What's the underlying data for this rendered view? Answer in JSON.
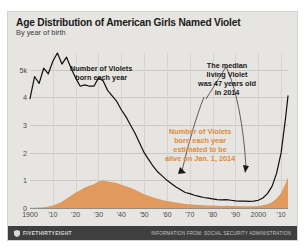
{
  "header": {
    "title": "Age Distribution of American Girls Named Violet",
    "subtitle": "By year of birth"
  },
  "footer": {
    "brand": "FIVETHIRTYEIGHT",
    "logo_icon": "shield-icon",
    "source": "INFORMATION FROM: SOCIAL SECURITY ADMINISTRATION"
  },
  "colors": {
    "background": "#e6e5e1",
    "line": "#101010",
    "area": "#e09a5e",
    "area_text": "#e08a3c",
    "footer_bg": "#3f3f3f",
    "grid": "#c9c8c3"
  },
  "chart_data": {
    "type": "line",
    "title": "Age Distribution of American Girls Named Violet",
    "subtitle": "By year of birth",
    "xlabel": "",
    "ylabel": "",
    "xlim": [
      1900,
      2013
    ],
    "ylim": [
      0,
      5600
    ],
    "grid": true,
    "legend_position": "annotations",
    "ytick_labels": [
      "0",
      "1",
      "2",
      "3",
      "4",
      "5k"
    ],
    "ytick_values": [
      0,
      1000,
      2000,
      3000,
      4000,
      5000
    ],
    "xtick_labels": [
      "1900",
      "'10",
      "'20",
      "'30",
      "'40",
      "'50",
      "'60",
      "'70",
      "'80",
      "'90",
      "2000",
      "'10"
    ],
    "xtick_values": [
      1900,
      1910,
      1920,
      1930,
      1940,
      1950,
      1960,
      1970,
      1980,
      1990,
      2000,
      2010
    ],
    "annotations": [
      {
        "name": "born-each-year",
        "text": "Number of Violets\nborn each year",
        "color": "#1a1a1a",
        "points_to_series": "born"
      },
      {
        "name": "median-living-violet",
        "text": "The median\nliving Violet\nwas 47 years old\nin 2014",
        "color": "#1a1a1a"
      },
      {
        "name": "estimated-alive",
        "text": "Number of Violets\nborn each year\nestimated to be\nalive on Jan. 1, 2014",
        "color": "#e08a3c",
        "points_to_series": "alive"
      }
    ],
    "series": [
      {
        "name": "born",
        "label": "Number of Violets born each year",
        "style": "line",
        "color": "#101010",
        "x": [
          1900,
          1902,
          1904,
          1906,
          1908,
          1910,
          1912,
          1914,
          1916,
          1918,
          1920,
          1922,
          1924,
          1926,
          1928,
          1930,
          1932,
          1934,
          1936,
          1938,
          1940,
          1942,
          1944,
          1946,
          1948,
          1950,
          1952,
          1954,
          1956,
          1958,
          1960,
          1962,
          1964,
          1966,
          1968,
          1970,
          1972,
          1974,
          1976,
          1978,
          1980,
          1982,
          1984,
          1986,
          1988,
          1990,
          1992,
          1994,
          1996,
          1998,
          2000,
          2002,
          2004,
          2006,
          2008,
          2010,
          2012,
          2013
        ],
        "values": [
          3950,
          4750,
          4500,
          5050,
          4850,
          5300,
          5600,
          5200,
          5450,
          5050,
          4700,
          4400,
          4450,
          4400,
          4400,
          4700,
          4600,
          4250,
          4050,
          3850,
          3550,
          3300,
          3000,
          2700,
          2350,
          2000,
          1750,
          1500,
          1300,
          1150,
          1000,
          880,
          760,
          660,
          560,
          520,
          460,
          420,
          380,
          355,
          330,
          300,
          290,
          300,
          280,
          260,
          250,
          245,
          240,
          250,
          280,
          360,
          520,
          780,
          1250,
          2000,
          3300,
          4050
        ]
      },
      {
        "name": "alive",
        "label": "Number of Violets born each year estimated to be alive on Jan. 1, 2014",
        "style": "area",
        "color": "#e09a5e",
        "x": [
          1900,
          1902,
          1904,
          1906,
          1908,
          1910,
          1912,
          1914,
          1916,
          1918,
          1920,
          1922,
          1924,
          1926,
          1928,
          1930,
          1932,
          1934,
          1936,
          1938,
          1940,
          1942,
          1944,
          1946,
          1948,
          1950,
          1952,
          1954,
          1956,
          1958,
          1960,
          1962,
          1964,
          1966,
          1968,
          1970,
          1972,
          1974,
          1976,
          1978,
          1980,
          1982,
          1984,
          1986,
          1988,
          1990,
          1992,
          1994,
          1996,
          1998,
          2000,
          2002,
          2004,
          2006,
          2008,
          2010,
          2012,
          2013
        ],
        "values": [
          5,
          10,
          18,
          30,
          50,
          90,
          150,
          230,
          340,
          440,
          560,
          640,
          740,
          800,
          860,
          960,
          990,
          960,
          930,
          900,
          840,
          790,
          730,
          660,
          580,
          500,
          440,
          380,
          330,
          290,
          255,
          225,
          195,
          170,
          145,
          135,
          120,
          110,
          100,
          93,
          86,
          79,
          76,
          79,
          74,
          69,
          66,
          65,
          64,
          67,
          75,
          97,
          140,
          211,
          340,
          545,
          900,
          1110
        ]
      }
    ]
  }
}
